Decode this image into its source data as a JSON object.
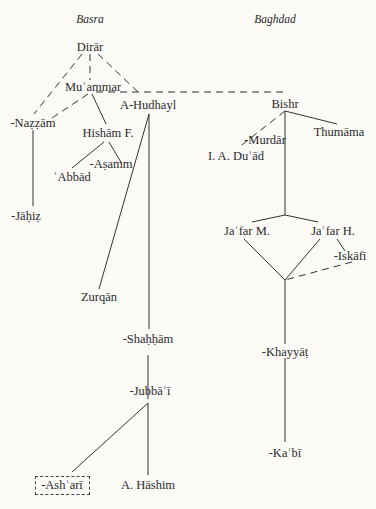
{
  "regions": {
    "left": "Basra",
    "right": "Baghdad"
  },
  "nodes": {
    "dirar": "Dirār",
    "muammar": "Muʿammar",
    "hudhayl": "A-Hudhayl",
    "nazzam": "-Naẓẓām",
    "hisham": "Hishām F.",
    "asamm": "-Aṣamm",
    "abbad": "ʿAbbād",
    "jahiz": "-Jāḥiẓ",
    "zurqan": "Zurqān",
    "shahham": "-Shaḥḥām",
    "jubbai": "-Jubbāʾī",
    "ashari": "-Ashʿarī",
    "hashim": "A. Hāshim",
    "bishr": "Bishr",
    "thumama": "Thumāma",
    "murdar": "-Murdār",
    "duad": "I. A. Duʾād",
    "jafar_m": "Jaʿfar M.",
    "jafar_h": "Jaʿfar H.",
    "iskafi": "-Iskāfī",
    "khayyat": "-Khayyāṭ",
    "kabi": "-Kaʿbī"
  },
  "edges": [
    {
      "from": "dirar",
      "to": "muammar",
      "style": "dashed"
    },
    {
      "from": "dirar",
      "to": "nazzam",
      "style": "dashed"
    },
    {
      "from": "dirar",
      "to": "hudhayl",
      "style": "dashed"
    },
    {
      "from": "muammar",
      "to": "nazzam",
      "style": "dashed"
    },
    {
      "from": "muammar",
      "to": "hisham",
      "style": "solid"
    },
    {
      "from": "muammar",
      "to": "bishr",
      "style": "dashed"
    },
    {
      "from": "hisham",
      "to": "asamm",
      "style": "solid"
    },
    {
      "from": "hisham",
      "to": "abbad",
      "style": "solid"
    },
    {
      "from": "nazzam",
      "to": "jahiz",
      "style": "solid"
    },
    {
      "from": "hudhayl",
      "to": "zurqan",
      "style": "solid"
    },
    {
      "from": "hudhayl",
      "to": "shahham",
      "style": "solid"
    },
    {
      "from": "shahham",
      "to": "jubbai",
      "style": "solid"
    },
    {
      "from": "jubbai",
      "to": "ashari",
      "style": "solid"
    },
    {
      "from": "jubbai",
      "to": "hashim",
      "style": "solid"
    },
    {
      "from": "bishr",
      "to": "thumama",
      "style": "solid"
    },
    {
      "from": "bishr",
      "to": "duad",
      "style": "dashed"
    },
    {
      "from": "bishr",
      "to": "murdar",
      "style": "solid"
    },
    {
      "from": "murdar",
      "to": "jafar_m",
      "style": "solid"
    },
    {
      "from": "murdar",
      "to": "jafar_h",
      "style": "solid"
    },
    {
      "from": "jafar_h",
      "to": "iskafi",
      "style": "solid"
    },
    {
      "from": "jafar_m",
      "to": "khayyat",
      "style": "solid"
    },
    {
      "from": "jafar_h",
      "to": "khayyat",
      "style": "solid"
    },
    {
      "from": "iskafi",
      "to": "khayyat",
      "style": "dashed"
    },
    {
      "from": "khayyat",
      "to": "kabi",
      "style": "solid"
    }
  ]
}
